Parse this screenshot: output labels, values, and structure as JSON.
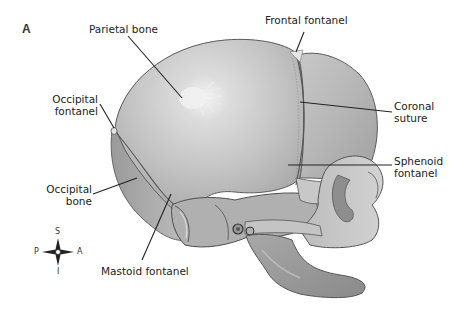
{
  "figure": {
    "panel_label": "A",
    "colors": {
      "background": "#ffffff",
      "bone_light": "#d6d6d6",
      "bone_mid": "#b4b4b4",
      "bone_dark": "#8e8e8e",
      "outline": "#555555",
      "leader_line": "#222222",
      "text": "#222222"
    }
  },
  "labels": {
    "parietal_bone": "Parietal bone",
    "frontal_fontanel": "Frontal fontanel",
    "occipital_fontanel_line1": "Occipital",
    "occipital_fontanel_line2": "fontanel",
    "coronal_suture_line1": "Coronal",
    "coronal_suture_line2": "suture",
    "sphenoid_fontanel_line1": "Sphenoid",
    "sphenoid_fontanel_line2": "fontanel",
    "occipital_bone_line1": "Occipital",
    "occipital_bone_line2": "bone",
    "mastoid_fontanel": "Mastoid fontanel"
  },
  "compass": {
    "superior": "S",
    "inferior": "I",
    "posterior": "P",
    "anterior": "A"
  }
}
